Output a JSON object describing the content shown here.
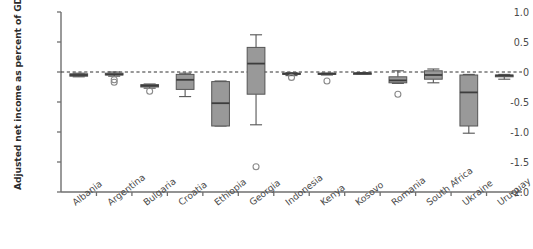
{
  "chart_data": {
    "type": "box",
    "title": "",
    "xlabel": "",
    "ylabel": "Adjusted net income as percent of GDP",
    "ylim": [
      -2.0,
      1.0
    ],
    "yticks": [
      1.0,
      0.5,
      0,
      -0.5,
      -1.0,
      -1.5,
      -2.0
    ],
    "ytick_labels": [
      "1.0",
      "0.5",
      "0",
      "-0.5",
      "-1.0",
      "-1.5",
      "-2.0"
    ],
    "grid": false,
    "legend": null,
    "reference_line": {
      "value": 0,
      "style": "dashed",
      "color": "#333333"
    },
    "box_fill": "#999999",
    "box_edge": "#555555",
    "categories": [
      "Albania",
      "Argentina",
      "Bulgaria",
      "Croatia",
      "Ethiopia",
      "Georgia",
      "Indonesia",
      "Kenya",
      "Kosovo",
      "Romania",
      "South Africa",
      "Ukraine",
      "Uruguay"
    ],
    "boxes": [
      {
        "category": "Albania",
        "whisker_low": -0.08,
        "q1": -0.07,
        "median": -0.05,
        "q3": -0.03,
        "whisker_high": -0.02,
        "outliers": []
      },
      {
        "category": "Argentina",
        "whisker_low": -0.07,
        "q1": -0.05,
        "median": -0.04,
        "q3": -0.02,
        "whisker_high": 0.0,
        "outliers": [
          -0.13,
          -0.17
        ]
      },
      {
        "category": "Bulgaria",
        "whisker_low": -0.27,
        "q1": -0.25,
        "median": -0.23,
        "q3": -0.21,
        "whisker_high": -0.2,
        "outliers": [
          -0.32
        ]
      },
      {
        "category": "Croatia",
        "whisker_low": -0.41,
        "q1": -0.29,
        "median": -0.13,
        "q3": -0.04,
        "whisker_high": -0.02,
        "outliers": []
      },
      {
        "category": "Ethiopia",
        "whisker_low": -0.9,
        "q1": -0.9,
        "median": -0.52,
        "q3": -0.16,
        "whisker_high": -0.15,
        "outliers": []
      },
      {
        "category": "Georgia",
        "whisker_low": -0.88,
        "q1": -0.37,
        "median": 0.14,
        "q3": 0.41,
        "whisker_high": 0.62,
        "outliers": [
          -1.58
        ]
      },
      {
        "category": "Indonesia",
        "whisker_low": -0.06,
        "q1": -0.04,
        "median": -0.03,
        "q3": -0.02,
        "whisker_high": -0.01,
        "outliers": [
          -0.09
        ]
      },
      {
        "category": "Kenya",
        "whisker_low": -0.05,
        "q1": -0.04,
        "median": -0.03,
        "q3": -0.02,
        "whisker_high": -0.02,
        "outliers": [
          -0.15
        ]
      },
      {
        "category": "Kosovo",
        "whisker_low": -0.04,
        "q1": -0.03,
        "median": -0.02,
        "q3": -0.02,
        "whisker_high": -0.01,
        "outliers": []
      },
      {
        "category": "Romania",
        "whisker_low": -0.19,
        "q1": -0.18,
        "median": -0.14,
        "q3": -0.08,
        "whisker_high": 0.02,
        "outliers": [
          -0.37
        ]
      },
      {
        "category": "South Africa",
        "whisker_low": -0.18,
        "q1": -0.12,
        "median": -0.05,
        "q3": 0.02,
        "whisker_high": 0.05,
        "outliers": []
      },
      {
        "category": "Ukraine",
        "whisker_low": -1.02,
        "q1": -0.9,
        "median": -0.34,
        "q3": -0.05,
        "whisker_high": -0.04,
        "outliers": []
      },
      {
        "category": "Uruguay",
        "whisker_low": -0.12,
        "q1": -0.08,
        "median": -0.06,
        "q3": -0.05,
        "whisker_high": -0.04,
        "outliers": []
      }
    ]
  }
}
